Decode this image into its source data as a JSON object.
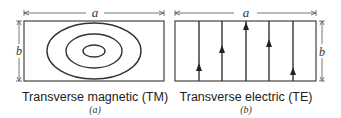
{
  "panels": [
    {
      "id": "a",
      "caption": "Transverse magnetic (TM)",
      "sublabel": "(a)",
      "width_label": "a",
      "height_label": "b",
      "field_pattern": "concentric-ellipses",
      "ellipse_count": 3
    },
    {
      "id": "b",
      "caption": "Transverse electric (TE)",
      "sublabel": "(b)",
      "width_label": "a",
      "height_label": "b",
      "field_pattern": "vertical-lines-upward-arrows",
      "line_count": 5
    }
  ],
  "colors": {
    "stroke": "#333333",
    "text": "#222222",
    "background": "#ffffff"
  }
}
